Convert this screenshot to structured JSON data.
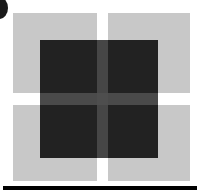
{
  "figure": {
    "caption": "",
    "canvas": {
      "width": 203,
      "height": 193,
      "background": "#ffffff"
    },
    "colors": {
      "background": "#ffffff",
      "light_gray": "#c8c8c8",
      "dark_fill": "#222222",
      "dark_gap_vertical": "#464646",
      "dark_gap_horizontal": "#4a4a4a",
      "dark_gap_center": "#4e4e4e",
      "rule_black": "#000000",
      "corner_mark": "#1a1a1a"
    },
    "gray_squares": [
      {
        "name": "top-left",
        "x": 13,
        "y": 13,
        "width": 84,
        "height": 80
      },
      {
        "name": "top-right",
        "x": 108,
        "y": 13,
        "width": 82,
        "height": 80
      },
      {
        "name": "bottom-left",
        "x": 13,
        "y": 105,
        "width": 84,
        "height": 76
      },
      {
        "name": "bottom-right",
        "x": 108,
        "y": 105,
        "width": 82,
        "height": 76
      }
    ],
    "dark_block": {
      "x": 40,
      "y": 40,
      "width": 118,
      "height": 118
    },
    "corner_mark": {
      "shape": "crescent",
      "x": -9,
      "y": -3,
      "width": 17,
      "height": 22
    },
    "bottom_rule": {
      "x": 3,
      "y": 186,
      "width": 194,
      "height": 4
    }
  }
}
